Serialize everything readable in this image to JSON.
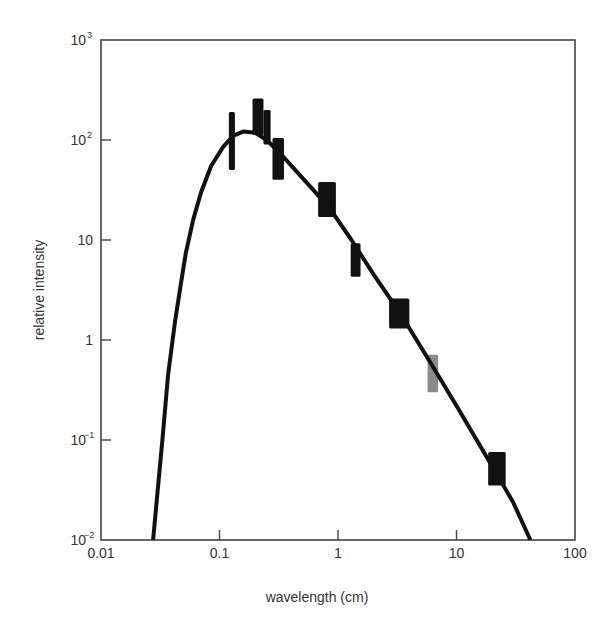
{
  "chart_data": {
    "type": "line",
    "title": "",
    "xlabel": "wavelength (cm)",
    "ylabel": "relative intensity",
    "xscale": "log",
    "yscale": "log",
    "xlim": [
      0.01,
      100
    ],
    "ylim": [
      0.01,
      1000
    ],
    "grid": false,
    "legend": null,
    "x_ticks": [
      {
        "value": 0.01,
        "label": "0.01"
      },
      {
        "value": 0.1,
        "label": "0.1"
      },
      {
        "value": 1,
        "label": "1"
      },
      {
        "value": 10,
        "label": "10"
      },
      {
        "value": 100,
        "label": "100"
      }
    ],
    "y_ticks": [
      {
        "value": 0.01,
        "base": "10",
        "exp": "−2"
      },
      {
        "value": 0.1,
        "base": "10",
        "exp": "−1"
      },
      {
        "value": 1,
        "base": "1",
        "exp": ""
      },
      {
        "value": 10,
        "base": "10",
        "exp": ""
      },
      {
        "value": 100,
        "base": "10",
        "exp": "2"
      },
      {
        "value": 1000,
        "base": "10",
        "exp": "3"
      }
    ],
    "series": [
      {
        "name": "blackbody curve",
        "kind": "line",
        "color": "#111111",
        "points": [
          [
            0.0275,
            0.01
          ],
          [
            0.03,
            0.03
          ],
          [
            0.033,
            0.1
          ],
          [
            0.0368,
            0.45
          ],
          [
            0.042,
            1.5
          ],
          [
            0.047,
            3.5
          ],
          [
            0.052,
            7.4
          ],
          [
            0.06,
            16
          ],
          [
            0.07,
            30
          ],
          [
            0.085,
            55
          ],
          [
            0.107,
            85
          ],
          [
            0.13,
            110
          ],
          [
            0.16,
            122
          ],
          [
            0.2,
            118
          ],
          [
            0.25,
            100
          ],
          [
            0.32,
            75
          ],
          [
            0.45,
            48
          ],
          [
            0.6,
            33
          ],
          [
            0.87,
            20
          ],
          [
            1.3,
            10
          ],
          [
            2.0,
            4.5
          ],
          [
            3.4,
            1.8
          ],
          [
            6.0,
            0.6
          ],
          [
            10,
            0.22
          ],
          [
            14.8,
            0.1
          ],
          [
            22,
            0.045
          ],
          [
            30,
            0.024
          ],
          [
            42,
            0.01
          ]
        ]
      },
      {
        "name": "measurements",
        "kind": "error-boxes",
        "color": "#111111",
        "boxes": [
          {
            "x_low": 0.12,
            "x_high": 0.135,
            "y_low": 50,
            "y_high": 190
          },
          {
            "x_low": 0.19,
            "x_high": 0.235,
            "y_low": 112,
            "y_high": 260
          },
          {
            "x_low": 0.235,
            "x_high": 0.27,
            "y_low": 90,
            "y_high": 200
          },
          {
            "x_low": 0.28,
            "x_high": 0.35,
            "y_low": 40,
            "y_high": 105
          },
          {
            "x_low": 0.68,
            "x_high": 0.96,
            "y_low": 17,
            "y_high": 38
          },
          {
            "x_low": 1.28,
            "x_high": 1.55,
            "y_low": 4.3,
            "y_high": 9.3
          },
          {
            "x_low": 2.7,
            "x_high": 4.0,
            "y_low": 1.3,
            "y_high": 2.6
          },
          {
            "x_low": 5.7,
            "x_high": 7.0,
            "y_low": 0.3,
            "y_high": 0.71,
            "color": "#8a8a8a"
          },
          {
            "x_low": 18.5,
            "x_high": 26,
            "y_low": 0.035,
            "y_high": 0.076
          }
        ]
      }
    ]
  },
  "layout": {
    "plot_left": 101,
    "plot_right": 575,
    "plot_top": 40,
    "plot_bottom": 540
  }
}
